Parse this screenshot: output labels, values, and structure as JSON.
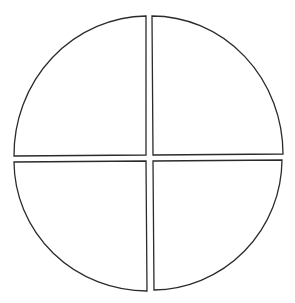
{
  "diagram": {
    "type": "divided-circle",
    "stroke_color": "#2b2b2b",
    "fill_color": "#ffffff",
    "background": "#ffffff",
    "quadrants": [
      {
        "id": "top-left",
        "label": ""
      },
      {
        "id": "top-right",
        "label": ""
      },
      {
        "id": "bottom-left",
        "label": ""
      },
      {
        "id": "bottom-right",
        "label": ""
      }
    ]
  }
}
